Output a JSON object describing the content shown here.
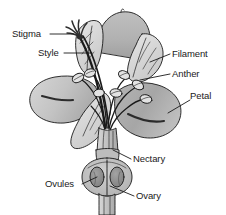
{
  "diagram": {
    "style": "grayscale line drawing with shaded fills",
    "background_color": "#ffffff",
    "outline_color": "#1a1a1a",
    "labels": [
      {
        "id": "stigma",
        "text": "Stigma",
        "x": 12,
        "y": 29,
        "side": "left",
        "leader": "M 50 34 L 74 34"
      },
      {
        "id": "style",
        "text": "Style",
        "x": 38,
        "y": 48,
        "side": "left",
        "leader": "M 64 53 L 92 53"
      },
      {
        "id": "filament",
        "text": "Filament",
        "x": 172,
        "y": 49,
        "side": "right",
        "leader": "M 170 54 L 150 62"
      },
      {
        "id": "anther",
        "text": "Anther",
        "x": 172,
        "y": 69,
        "side": "right",
        "leader": "M 170 74 L 140 80"
      },
      {
        "id": "petal",
        "text": "Petal",
        "x": 190,
        "y": 91,
        "side": "right",
        "leader": "M 190 100 L 168 113"
      },
      {
        "id": "nectary",
        "text": "Nectary",
        "x": 133,
        "y": 154,
        "side": "right",
        "leader": "M 131 159 L 113 150"
      },
      {
        "id": "ovules",
        "text": "Ovules",
        "x": 45,
        "y": 179,
        "side": "left",
        "leader": "M 82 184 L 97 177"
      },
      {
        "id": "ovary",
        "text": "Ovary",
        "x": 136,
        "y": 191,
        "side": "right",
        "leader": "M 134 196 L 110 186"
      }
    ],
    "colors": {
      "petal_light": "#d2d2d2",
      "petal_mid": "#b6b6b6",
      "petal_dark": "#9a9a9a",
      "sepal_pale": "#dcdcdc",
      "stem_light": "#c4c4c4",
      "ovary_fill": "#c0c0c0",
      "ovule_fill": "#8f8f8f",
      "anther_fill": "#e0e0e0",
      "stigma_dark": "#2e2e2e",
      "stroke": "#1a1a1a",
      "text": "#1a1a1a"
    },
    "parts": [
      {
        "id": "stigma",
        "name": "Stigma",
        "description": "feathery dark receptive tip at top of style"
      },
      {
        "id": "style",
        "name": "Style",
        "description": "slender stalk connecting stigma to ovary"
      },
      {
        "id": "filament",
        "name": "Filament",
        "description": "stalk supporting the anther"
      },
      {
        "id": "anther",
        "name": "Anther",
        "description": "pollen-bearing oval sacs at filament tips"
      },
      {
        "id": "petal",
        "name": "Petal",
        "description": "broad rounded shaded flower petals"
      },
      {
        "id": "nectary",
        "name": "Nectary",
        "description": "gland at base of flower above ovary"
      },
      {
        "id": "ovules",
        "name": "Ovules",
        "description": "dark oval bodies inside the ovary chambers"
      },
      {
        "id": "ovary",
        "name": "Ovary",
        "description": "swollen basal chamber enclosing the ovules"
      }
    ]
  }
}
